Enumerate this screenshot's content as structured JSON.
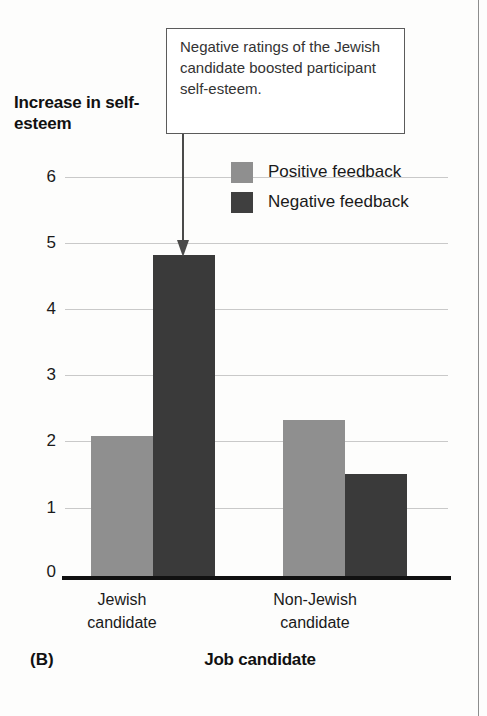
{
  "figure": {
    "panel_label": "(B)",
    "callout_text": "Negative ratings of the Jewish candidate boosted participant self-esteem.",
    "accent_colors": {
      "positive_bar": "#8f8f8f",
      "negative_bar": "#3a3a3a",
      "gridline": "#c9c9c9",
      "axis": "#111111"
    }
  },
  "chart_data": {
    "type": "bar",
    "title": "",
    "xlabel": "Job candidate",
    "ylabel": "Increase in self-esteem",
    "categories": [
      "Jewish candidate",
      "Non-Jewish candidate"
    ],
    "category_lines": [
      [
        "Jewish",
        "candidate"
      ],
      [
        "Non-Jewish",
        "candidate"
      ]
    ],
    "series": [
      {
        "name": "Positive feedback",
        "color": "#8f8f8f",
        "values": [
          2.1,
          2.33
        ]
      },
      {
        "name": "Negative feedback",
        "color": "#3a3a3a",
        "values": [
          4.8,
          1.52
        ]
      }
    ],
    "ylim": [
      0,
      6
    ],
    "yticks": [
      6,
      5,
      4,
      3,
      2,
      1,
      0
    ],
    "ytick_labels": [
      "6",
      "5",
      "4",
      "3",
      "2",
      "1",
      "0"
    ],
    "grid": true,
    "grid_axis": "y",
    "legend_position": "upper-center",
    "annotations": [
      {
        "text": "Negative ratings of the Jewish candidate boosted participant self-esteem.",
        "points_to_series": "Negative feedback",
        "points_to_category": "Jewish candidate"
      }
    ]
  }
}
